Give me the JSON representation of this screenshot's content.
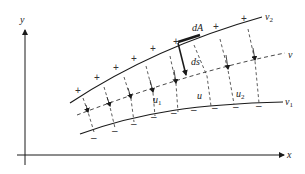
{
  "diagram": {
    "axes": {
      "x_label": "x",
      "y_label": "y"
    },
    "curves": {
      "upper": {
        "label": "v",
        "subscript": "2"
      },
      "middle": {
        "label": "v",
        "subscript": ""
      },
      "lower": {
        "label": "v",
        "subscript": "1"
      }
    },
    "field_labels": {
      "area_element": "dA",
      "line_element": "ds"
    },
    "u_labels": [
      {
        "label": "u",
        "subscript": "1"
      },
      {
        "label": "u",
        "subscript": ""
      },
      {
        "label": "u",
        "subscript": "2"
      }
    ],
    "charges": {
      "positive_symbol": "+",
      "negative_symbol": "–",
      "positive_count": 10,
      "negative_count": 10
    },
    "colors": {
      "line": "#1a1a1a",
      "dashed": "#333333",
      "background": "#ffffff"
    }
  }
}
